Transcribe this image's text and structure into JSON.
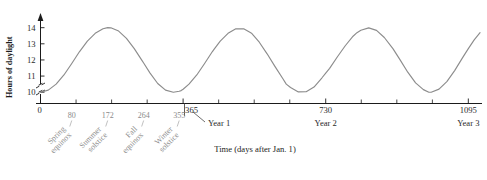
{
  "chart_data": {
    "type": "line",
    "title": "",
    "xlabel": "Time (days after Jan. 1)",
    "ylabel": "Hours of daylight",
    "xlim": [
      0,
      1130
    ],
    "ylim": [
      9.3,
      14.6
    ],
    "grid": false,
    "legend": null,
    "axis_break_y": true,
    "y_ticks": [
      10,
      11,
      12,
      13,
      14
    ],
    "y_tick_labels": [
      "10",
      "11",
      "12",
      "13",
      "14"
    ],
    "x_major_ticks": [
      0,
      365,
      730,
      1095
    ],
    "x_major_tick_labels": [
      "0",
      "365",
      "730",
      "1095"
    ],
    "x_minor_ticks": [
      91,
      182,
      273,
      456,
      547,
      638,
      821,
      912,
      1003
    ],
    "x_annotation_ticks": [
      80,
      172,
      264,
      355
    ],
    "x_annotation_labels": [
      "80",
      "172",
      "264",
      "355"
    ],
    "year_labels": [
      "Year 1",
      "Year 2",
      "Year 3"
    ],
    "year_label_positions": [
      365,
      730,
      1095
    ],
    "season_labels": [
      {
        "day": 80,
        "line1": "Spring",
        "line2": "equinox"
      },
      {
        "day": 172,
        "line1": "Summer",
        "line2": "solstice"
      },
      {
        "day": 264,
        "line1": "Fall",
        "line2": "equinox"
      },
      {
        "day": 355,
        "line1": "Winter",
        "line2": "solstice"
      }
    ],
    "series": [
      {
        "name": "Hours of daylight",
        "color": "#8c8c8c",
        "description": "Sinusoid: 12 + 2*sin(2*pi*(t-80)/365)",
        "x": [
          0,
          20,
          40,
          60,
          80,
          100,
          120,
          140,
          160,
          172,
          180,
          200,
          220,
          240,
          260,
          264,
          280,
          300,
          320,
          340,
          355,
          360,
          365,
          380,
          400,
          420,
          440,
          445,
          460,
          480,
          500,
          520,
          537,
          540,
          560,
          580,
          600,
          620,
          629,
          640,
          660,
          680,
          700,
          720,
          730,
          740,
          760,
          780,
          800,
          810,
          820,
          840,
          860,
          880,
          900,
          902,
          920,
          940,
          960,
          980,
          994,
          1000,
          1020,
          1040,
          1060,
          1080,
          1095,
          1110,
          1125
        ],
        "y": [
          10.0,
          10.13,
          10.5,
          11.07,
          11.78,
          12.52,
          13.17,
          13.65,
          13.93,
          14.0,
          13.99,
          13.79,
          13.34,
          12.7,
          11.96,
          11.81,
          11.2,
          10.54,
          10.13,
          10.0,
          10.06,
          10.1,
          10.18,
          10.5,
          11.07,
          11.78,
          12.52,
          12.69,
          13.17,
          13.65,
          13.93,
          13.93,
          13.7,
          13.66,
          13.1,
          12.38,
          11.6,
          10.85,
          10.5,
          10.29,
          10.02,
          10.03,
          10.32,
          10.88,
          11.18,
          11.48,
          12.2,
          12.88,
          13.47,
          13.69,
          13.84,
          13.99,
          13.83,
          13.39,
          12.76,
          12.7,
          12.02,
          11.24,
          10.58,
          10.16,
          10.0,
          10.0,
          10.19,
          10.66,
          11.34,
          12.13,
          12.7,
          13.24,
          13.69
        ]
      }
    ]
  }
}
